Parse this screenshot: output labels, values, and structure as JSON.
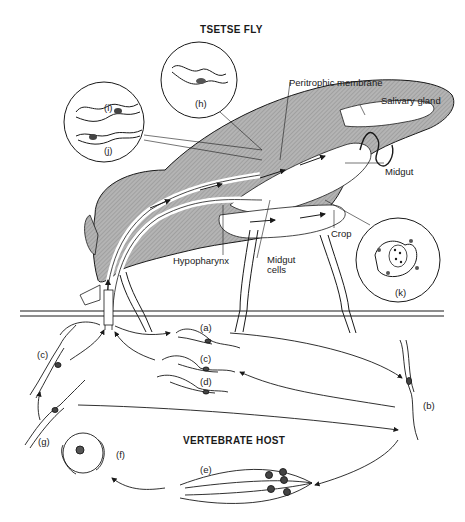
{
  "titles": {
    "vector": "TSETSE FLY",
    "host": "VERTEBRATE HOST"
  },
  "anatomy_labels": {
    "peritrophic_membrane": "Peritrophic membrane",
    "salivary_gland": "Salivary gland",
    "midgut": "Midgut",
    "crop": "Crop",
    "hypopharynx": "Hypopharynx",
    "midgut_cells": "Midgut cells"
  },
  "stages": {
    "a": "(a)",
    "b": "(b)",
    "c_host": "(c)",
    "c_left": "(c)",
    "d": "(d)",
    "e": "(e)",
    "f": "(f)",
    "g": "(g)",
    "h": "(h)",
    "i": "(i)",
    "j": "(j)",
    "k": "(k)"
  },
  "colors": {
    "ink": "#1a1a1a",
    "tissue_fill": "#a9a9a9",
    "background": "#ffffff"
  }
}
